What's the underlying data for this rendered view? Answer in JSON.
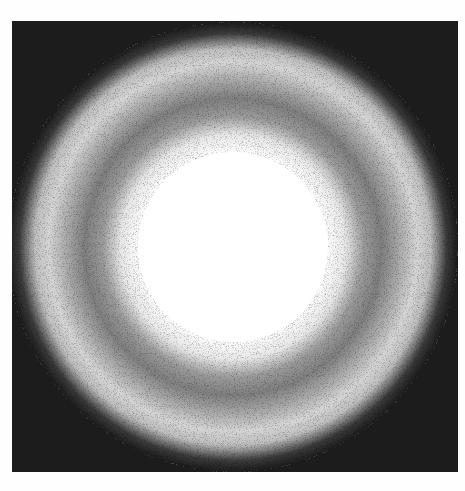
{
  "image": {
    "description": "Grayscale noisy ring/halo pattern on dark square background",
    "background_color": "#fefefe",
    "frame_color": "#1c1c1c",
    "core_color": "#ffffff",
    "band_mid_color": "#8a8a8a",
    "band_light_color": "#c8c8c8"
  }
}
